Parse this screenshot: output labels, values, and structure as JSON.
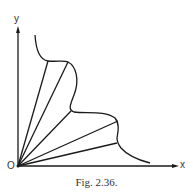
{
  "figure": {
    "caption": "Fig. 2.36.",
    "axis_x_label": "x",
    "axis_y_label": "y",
    "origin_label": "O",
    "stroke_color": "#1a1a1a"
  }
}
